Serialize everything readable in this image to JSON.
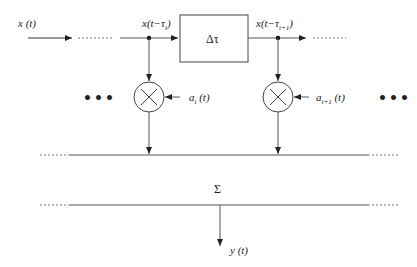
{
  "diagram": {
    "input_label": "x (t)",
    "tap_i_label": "x(t−τ",
    "tap_i_sub": "i",
    "tap_i_close": ")",
    "tap_i1_label": "x(t−τ",
    "tap_i1_sub": "i+1",
    "tap_i1_close": ")",
    "delay_block_label": "Δτ",
    "coef_i_label": "a",
    "coef_i_sub": "i",
    "coef_i_arg": "(t)",
    "coef_i1_label": "a",
    "coef_i1_sub": "i+1",
    "coef_i1_arg": "(t)",
    "ellipsis_left": "•••",
    "ellipsis_right": "•••",
    "sum_label": "Σ",
    "output_label": "y (t)",
    "multiplier_symbol": "×",
    "line_color": "#555555"
  }
}
